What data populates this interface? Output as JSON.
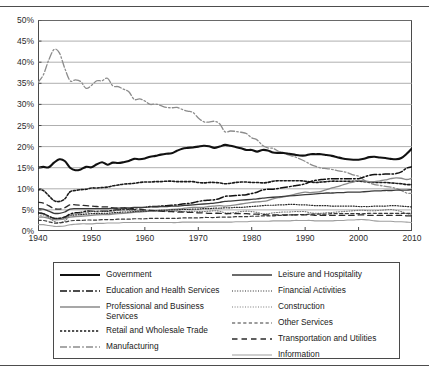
{
  "chart_data": {
    "type": "line",
    "title": "",
    "xlabel": "",
    "ylabel": "",
    "xlim": [
      1940,
      2010
    ],
    "ylim": [
      0,
      50
    ],
    "ytick_labels": [
      "0%",
      "5%",
      "10%",
      "15%",
      "20%",
      "25%",
      "30%",
      "35%",
      "40%",
      "45%",
      "50%"
    ],
    "ytick_values": [
      0,
      5,
      10,
      15,
      20,
      25,
      30,
      35,
      40,
      45,
      50
    ],
    "xtick_labels": [
      "1940",
      "1950",
      "1960",
      "1970",
      "1980",
      "1990",
      "2000",
      "2010"
    ],
    "xtick_values": [
      1940,
      1950,
      1960,
      1970,
      1980,
      1990,
      2000,
      2010
    ],
    "grid": "horizontal",
    "legend_position": "below-plot-two-columns",
    "x": [
      1940,
      1941,
      1942,
      1943,
      1944,
      1945,
      1946,
      1947,
      1948,
      1949,
      1950,
      1951,
      1952,
      1953,
      1954,
      1955,
      1956,
      1957,
      1958,
      1959,
      1960,
      1961,
      1962,
      1963,
      1964,
      1965,
      1966,
      1967,
      1968,
      1969,
      1970,
      1971,
      1972,
      1973,
      1974,
      1975,
      1976,
      1977,
      1978,
      1979,
      1980,
      1981,
      1982,
      1983,
      1984,
      1985,
      1986,
      1987,
      1988,
      1989,
      1990,
      1991,
      1992,
      1993,
      1994,
      1995,
      1996,
      1997,
      1998,
      1999,
      2000,
      2001,
      2002,
      2003,
      2004,
      2005,
      2006,
      2007,
      2008,
      2009,
      2010
    ],
    "series": [
      {
        "name": "Manufacturing",
        "style": "dash-dot",
        "color": "#8c8c8c",
        "width": 1.3,
        "values": [
          35.2,
          37.0,
          40.5,
          43.0,
          42.2,
          38.6,
          35.6,
          35.8,
          35.4,
          33.8,
          34.5,
          35.6,
          35.6,
          36.2,
          34.4,
          34.2,
          33.6,
          33.0,
          31.2,
          31.3,
          30.8,
          30.0,
          30.1,
          29.7,
          29.3,
          29.2,
          29.3,
          28.8,
          28.4,
          28.1,
          26.8,
          25.9,
          25.8,
          26.0,
          25.4,
          23.5,
          23.7,
          23.6,
          23.4,
          23.1,
          22.1,
          21.6,
          20.3,
          19.7,
          19.6,
          18.9,
          18.4,
          18.0,
          17.6,
          17.1,
          16.5,
          15.8,
          15.3,
          14.9,
          14.8,
          14.6,
          14.3,
          14.1,
          13.8,
          13.3,
          13.0,
          12.1,
          11.4,
          11.0,
          10.8,
          10.6,
          10.4,
          10.1,
          9.6,
          9.0,
          8.9
        ]
      },
      {
        "name": "Government",
        "style": "solid",
        "color": "#111111",
        "width": 2.1,
        "values": [
          15.0,
          15.2,
          15.1,
          16.2,
          17.0,
          16.6,
          15.0,
          14.4,
          14.6,
          15.2,
          15.1,
          15.8,
          16.3,
          15.7,
          16.2,
          16.1,
          16.3,
          16.6,
          17.1,
          17.0,
          17.2,
          17.6,
          17.8,
          18.1,
          18.3,
          18.4,
          19.0,
          19.5,
          19.7,
          19.8,
          20.0,
          20.2,
          20.1,
          19.7,
          20.0,
          20.4,
          20.2,
          19.9,
          19.6,
          19.2,
          19.2,
          18.8,
          19.2,
          19.1,
          18.6,
          18.5,
          18.5,
          18.3,
          18.1,
          17.9,
          17.9,
          18.2,
          18.2,
          18.2,
          18.0,
          17.8,
          17.5,
          17.2,
          17.0,
          16.9,
          16.9,
          17.1,
          17.5,
          17.6,
          17.4,
          17.3,
          17.1,
          17.0,
          17.3,
          18.3,
          19.6
        ]
      },
      {
        "name": "Retail and Wholesale Trade",
        "style": "dotted-square",
        "color": "#1a1a1a",
        "width": 1.6,
        "values": [
          9.8,
          9.6,
          8.4,
          7.2,
          7.0,
          7.6,
          9.3,
          9.6,
          9.8,
          9.9,
          10.2,
          10.2,
          10.3,
          10.4,
          10.7,
          10.9,
          11.1,
          11.2,
          11.3,
          11.5,
          11.6,
          11.6,
          11.7,
          11.7,
          11.8,
          11.8,
          11.7,
          11.7,
          11.7,
          11.7,
          11.5,
          11.4,
          11.5,
          11.5,
          11.4,
          11.2,
          11.3,
          11.5,
          11.6,
          11.6,
          11.5,
          11.5,
          11.4,
          11.5,
          11.8,
          11.9,
          11.9,
          11.9,
          11.9,
          11.9,
          11.8,
          11.6,
          11.5,
          11.6,
          11.7,
          11.8,
          11.8,
          11.8,
          11.8,
          11.8,
          11.8,
          11.7,
          11.6,
          11.5,
          11.5,
          11.5,
          11.4,
          11.3,
          11.2,
          11.0,
          11.0
        ]
      },
      {
        "name": "Education and Health Services",
        "style": "dash-dot",
        "color": "#111111",
        "width": 1.5,
        "values": [
          4.3,
          4.1,
          3.5,
          3.0,
          3.0,
          3.3,
          4.0,
          4.3,
          4.4,
          4.7,
          4.7,
          4.6,
          4.7,
          4.7,
          4.9,
          5.0,
          5.1,
          5.2,
          5.5,
          5.5,
          5.6,
          5.8,
          5.8,
          5.9,
          6.0,
          6.1,
          6.2,
          6.4,
          6.5,
          6.7,
          7.0,
          7.2,
          7.3,
          7.4,
          7.7,
          8.2,
          8.3,
          8.4,
          8.5,
          8.6,
          8.9,
          9.2,
          9.7,
          9.9,
          9.9,
          10.1,
          10.3,
          10.5,
          10.7,
          10.9,
          11.2,
          11.7,
          12.0,
          12.2,
          12.3,
          12.4,
          12.4,
          12.4,
          12.4,
          12.4,
          12.4,
          12.8,
          13.2,
          13.4,
          13.4,
          13.5,
          13.5,
          13.6,
          14.0,
          14.9,
          15.2
        ]
      },
      {
        "name": "Professional and Business Services",
        "style": "solid",
        "color": "#8a8a8a",
        "width": 1.3,
        "values": [
          3.3,
          3.3,
          3.0,
          2.7,
          2.7,
          2.9,
          3.3,
          3.4,
          3.5,
          3.6,
          3.7,
          3.8,
          3.9,
          3.9,
          4.0,
          4.1,
          4.2,
          4.3,
          4.4,
          4.5,
          4.6,
          4.7,
          4.8,
          4.9,
          5.0,
          5.1,
          5.2,
          5.3,
          5.5,
          5.6,
          5.6,
          5.6,
          5.8,
          5.9,
          6.0,
          5.9,
          6.0,
          6.2,
          6.4,
          6.6,
          6.8,
          6.9,
          7.0,
          7.2,
          7.6,
          7.9,
          8.1,
          8.4,
          8.7,
          9.0,
          9.2,
          9.1,
          9.2,
          9.4,
          9.8,
          10.2,
          10.5,
          10.9,
          11.3,
          11.6,
          12.0,
          11.9,
          11.7,
          11.7,
          11.9,
          12.1,
          12.4,
          12.6,
          12.5,
          12.2,
          12.5
        ]
      },
      {
        "name": "Leisure and Hospitality",
        "style": "solid",
        "color": "#3a3a3a",
        "width": 1.3,
        "values": [
          5.3,
          5.2,
          4.7,
          4.2,
          4.2,
          4.5,
          5.2,
          5.3,
          5.3,
          5.3,
          5.3,
          5.3,
          5.3,
          5.3,
          5.4,
          5.4,
          5.5,
          5.5,
          5.6,
          5.6,
          5.6,
          5.7,
          5.7,
          5.8,
          5.8,
          5.9,
          5.9,
          6.0,
          6.1,
          6.2,
          6.3,
          6.4,
          6.5,
          6.6,
          6.8,
          7.0,
          7.1,
          7.2,
          7.3,
          7.4,
          7.5,
          7.6,
          7.8,
          7.9,
          8.0,
          8.1,
          8.2,
          8.3,
          8.4,
          8.5,
          8.6,
          8.7,
          8.8,
          8.9,
          9.0,
          9.0,
          9.1,
          9.1,
          9.2,
          9.2,
          9.2,
          9.3,
          9.4,
          9.5,
          9.5,
          9.6,
          9.6,
          9.7,
          9.7,
          9.7,
          9.8
        ]
      },
      {
        "name": "Financial Activities",
        "style": "dotted-fine",
        "color": "#2b2b2b",
        "width": 1.2,
        "values": [
          4.2,
          4.1,
          3.5,
          3.0,
          3.0,
          3.2,
          3.7,
          3.8,
          3.9,
          4.0,
          4.1,
          4.1,
          4.2,
          4.2,
          4.3,
          4.4,
          4.5,
          4.5,
          4.6,
          4.7,
          4.7,
          4.8,
          4.8,
          4.9,
          4.9,
          5.0,
          5.0,
          5.1,
          5.1,
          5.2,
          5.2,
          5.3,
          5.3,
          5.4,
          5.4,
          5.5,
          5.5,
          5.6,
          5.6,
          5.7,
          5.8,
          5.9,
          6.0,
          6.1,
          6.1,
          6.2,
          6.2,
          6.3,
          6.3,
          6.2,
          6.2,
          6.1,
          6.0,
          6.0,
          6.0,
          5.9,
          5.9,
          5.9,
          5.9,
          5.9,
          5.8,
          5.8,
          5.8,
          5.9,
          5.9,
          5.9,
          6.0,
          6.0,
          5.9,
          5.8,
          5.7
        ]
      },
      {
        "name": "Construction",
        "style": "dotted-fine",
        "color": "#7a7a7a",
        "width": 1.1,
        "values": [
          3.6,
          3.8,
          3.2,
          2.3,
          2.0,
          2.4,
          3.6,
          4.0,
          4.3,
          4.3,
          4.6,
          4.6,
          4.7,
          4.7,
          4.7,
          4.9,
          5.0,
          4.9,
          4.8,
          4.9,
          4.8,
          4.7,
          4.7,
          4.7,
          4.7,
          4.7,
          4.7,
          4.6,
          4.6,
          4.7,
          4.6,
          4.6,
          4.7,
          4.8,
          4.7,
          4.3,
          4.3,
          4.4,
          4.6,
          4.7,
          4.6,
          4.4,
          4.1,
          4.1,
          4.3,
          4.4,
          4.5,
          4.5,
          4.6,
          4.6,
          4.6,
          4.3,
          4.2,
          4.2,
          4.3,
          4.4,
          4.5,
          4.6,
          4.7,
          4.8,
          4.9,
          4.9,
          4.8,
          4.8,
          4.9,
          5.0,
          5.1,
          4.9,
          4.6,
          4.1,
          3.9
        ]
      },
      {
        "name": "Other Services",
        "style": "dashed",
        "color": "#3a3a3a",
        "width": 1.2,
        "values": [
          2.5,
          2.5,
          2.2,
          1.9,
          1.9,
          2.1,
          2.4,
          2.5,
          2.5,
          2.6,
          2.6,
          2.6,
          2.7,
          2.7,
          2.7,
          2.8,
          2.8,
          2.8,
          2.9,
          2.9,
          2.9,
          3.0,
          3.0,
          3.0,
          3.0,
          3.0,
          3.0,
          3.1,
          3.1,
          3.1,
          3.1,
          3.2,
          3.2,
          3.2,
          3.3,
          3.3,
          3.3,
          3.4,
          3.4,
          3.4,
          3.5,
          3.5,
          3.6,
          3.6,
          3.6,
          3.7,
          3.7,
          3.8,
          3.8,
          3.9,
          3.9,
          4.0,
          4.0,
          4.0,
          4.0,
          4.1,
          4.1,
          4.1,
          4.1,
          4.1,
          4.1,
          4.1,
          4.2,
          4.2,
          4.2,
          4.2,
          4.2,
          4.2,
          4.2,
          4.2,
          4.2
        ]
      },
      {
        "name": "Transportation and Utilities",
        "style": "long-dash",
        "color": "#2b2b2b",
        "width": 1.3,
        "values": [
          6.8,
          6.6,
          6.0,
          5.3,
          5.2,
          5.5,
          6.2,
          6.2,
          6.1,
          6.0,
          5.9,
          5.8,
          5.7,
          5.7,
          5.5,
          5.4,
          5.4,
          5.3,
          5.1,
          5.1,
          5.0,
          4.9,
          4.8,
          4.7,
          4.6,
          4.6,
          4.5,
          4.5,
          4.4,
          4.4,
          4.3,
          4.3,
          4.2,
          4.2,
          4.2,
          4.1,
          4.1,
          4.1,
          4.1,
          4.1,
          4.0,
          4.0,
          3.9,
          3.8,
          3.8,
          3.8,
          3.8,
          3.8,
          3.8,
          3.8,
          3.8,
          3.8,
          3.7,
          3.7,
          3.7,
          3.7,
          3.7,
          3.7,
          3.7,
          3.7,
          3.8,
          3.8,
          3.7,
          3.7,
          3.7,
          3.7,
          3.7,
          3.7,
          3.7,
          3.6,
          3.6
        ]
      },
      {
        "name": "Information",
        "style": "solid",
        "color": "#9e9e9e",
        "width": 1.1,
        "values": [
          1.5,
          1.5,
          1.3,
          1.1,
          1.1,
          1.2,
          1.5,
          1.6,
          1.7,
          1.7,
          1.7,
          1.8,
          1.8,
          1.9,
          1.9,
          1.9,
          2.0,
          2.0,
          2.0,
          2.0,
          2.0,
          2.0,
          2.0,
          2.0,
          2.0,
          2.0,
          2.0,
          2.1,
          2.1,
          2.1,
          2.1,
          2.1,
          2.1,
          2.1,
          2.1,
          2.1,
          2.1,
          2.2,
          2.2,
          2.2,
          2.3,
          2.3,
          2.3,
          2.3,
          2.4,
          2.4,
          2.4,
          2.4,
          2.5,
          2.5,
          2.5,
          2.5,
          2.4,
          2.4,
          2.4,
          2.4,
          2.5,
          2.5,
          2.6,
          2.6,
          2.7,
          2.7,
          2.6,
          2.4,
          2.3,
          2.3,
          2.3,
          2.2,
          2.2,
          2.1,
          2.0
        ]
      }
    ]
  },
  "legend": {
    "left_column": [
      {
        "label": "Government"
      },
      {
        "label": "Education and Health Services"
      },
      {
        "label": "Professional and Business Services"
      },
      {
        "label": "Retail and Wholesale Trade"
      },
      {
        "label": "Manufacturing"
      }
    ],
    "right_column": [
      {
        "label": "Leisure and Hospitality"
      },
      {
        "label": "Financial Activities"
      },
      {
        "label": "Construction"
      },
      {
        "label": "Other Services"
      },
      {
        "label": "Transportation and Utilities"
      },
      {
        "label": "Information"
      }
    ]
  }
}
